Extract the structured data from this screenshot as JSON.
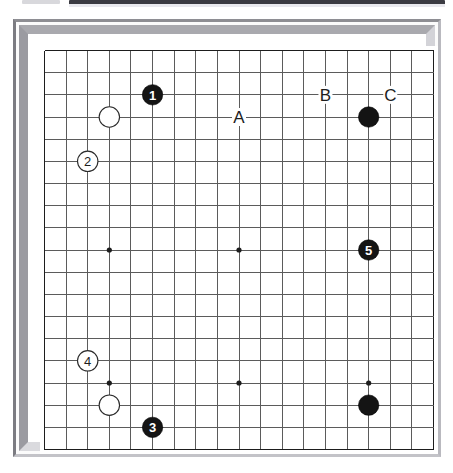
{
  "app": {
    "title": "Go Board Diagram",
    "top_chrome": {
      "left_block_label": "toolbar-fragment",
      "bar_label": "title-bar-fragment"
    }
  },
  "board": {
    "type": "go-board",
    "size": 19,
    "columns": 19,
    "rows": 19,
    "grid_color": "#5b5b5b",
    "edge_color": "#1d1d1d",
    "surface_color": "#ffffff",
    "frame_color": "#a9a9ae",
    "star_points": [
      {
        "col": 4,
        "row": 4
      },
      {
        "col": 10,
        "row": 4
      },
      {
        "col": 16,
        "row": 4
      },
      {
        "col": 4,
        "row": 10
      },
      {
        "col": 10,
        "row": 10
      },
      {
        "col": 16,
        "row": 10
      },
      {
        "col": 4,
        "row": 16
      },
      {
        "col": 10,
        "row": 16
      },
      {
        "col": 16,
        "row": 16
      }
    ],
    "stones": [
      {
        "id": "stone-w-c4r4",
        "col": 4,
        "row": 4,
        "color": "white",
        "number": ""
      },
      {
        "id": "stone-b-1",
        "col": 6,
        "row": 3,
        "color": "black",
        "number": "1"
      },
      {
        "id": "stone-w-2",
        "col": 3,
        "row": 6,
        "color": "white",
        "number": "2"
      },
      {
        "id": "stone-b-c16r4",
        "col": 16,
        "row": 4,
        "color": "black",
        "number": ""
      },
      {
        "id": "stone-b-5",
        "col": 16,
        "row": 10,
        "color": "black",
        "number": "5"
      },
      {
        "id": "stone-w-4",
        "col": 3,
        "row": 15,
        "color": "white",
        "number": "4"
      },
      {
        "id": "stone-w-c4r17",
        "col": 4,
        "row": 17,
        "color": "white",
        "number": ""
      },
      {
        "id": "stone-b-3",
        "col": 6,
        "row": 18,
        "color": "black",
        "number": "3"
      },
      {
        "id": "stone-b-c16r17",
        "col": 16,
        "row": 17,
        "color": "black",
        "number": ""
      }
    ],
    "point_labels": [
      {
        "id": "label-a",
        "col": 10,
        "row": 4,
        "text": "A"
      },
      {
        "id": "label-b",
        "col": 14,
        "row": 3,
        "text": "B"
      },
      {
        "id": "label-c",
        "col": 17,
        "row": 3,
        "text": "C"
      }
    ]
  },
  "chart_data": {
    "type": "table",
    "xlabel": "column (1-19, left to right)",
    "ylabel": "row (1-19, top to bottom)",
    "columns": [
      "marker",
      "column",
      "row",
      "color",
      "kind"
    ],
    "rows": [
      [
        "1",
        6,
        3,
        "black",
        "numbered-move"
      ],
      [
        "2",
        3,
        6,
        "white",
        "numbered-move"
      ],
      [
        "3",
        6,
        18,
        "black",
        "numbered-move"
      ],
      [
        "4",
        3,
        15,
        "white",
        "numbered-move"
      ],
      [
        "5",
        16,
        10,
        "black",
        "numbered-move"
      ],
      [
        "",
        4,
        4,
        "white",
        "plain-stone"
      ],
      [
        "",
        16,
        4,
        "black",
        "plain-stone"
      ],
      [
        "",
        4,
        17,
        "white",
        "plain-stone"
      ],
      [
        "",
        16,
        17,
        "black",
        "plain-stone"
      ],
      [
        "A",
        10,
        4,
        "none",
        "point-label"
      ],
      [
        "B",
        14,
        3,
        "none",
        "point-label"
      ],
      [
        "C",
        17,
        3,
        "none",
        "point-label"
      ]
    ]
  }
}
